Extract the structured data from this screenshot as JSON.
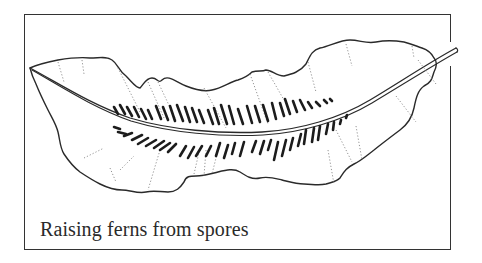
{
  "figure": {
    "caption": "Raising ferns from spores",
    "colors": {
      "ink": "#2a2a2a",
      "border": "#333333",
      "background": "#ffffff",
      "vein_dots": "#888888"
    }
  }
}
